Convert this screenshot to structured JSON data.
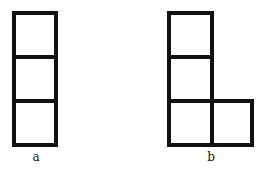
{
  "figures": [
    {
      "id": "a",
      "label": "a",
      "label_pos": [
        36,
        150
      ],
      "cells": [
        {
          "x": 12,
          "y": 11,
          "w": 46,
          "h": 48
        },
        {
          "x": 12,
          "y": 55,
          "w": 46,
          "h": 48
        },
        {
          "x": 12,
          "y": 99,
          "w": 46,
          "h": 48
        }
      ]
    },
    {
      "id": "b",
      "label": "b",
      "label_pos": [
        211,
        150
      ],
      "cells": [
        {
          "x": 167,
          "y": 11,
          "w": 47,
          "h": 48
        },
        {
          "x": 167,
          "y": 55,
          "w": 47,
          "h": 48
        },
        {
          "x": 167,
          "y": 99,
          "w": 47,
          "h": 48
        },
        {
          "x": 210,
          "y": 99,
          "w": 44,
          "h": 48
        }
      ]
    }
  ],
  "stroke_color": "#111111"
}
